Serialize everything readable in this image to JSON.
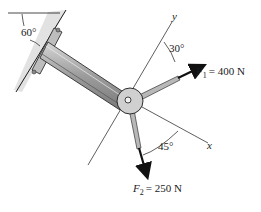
{
  "diagram": {
    "type": "statics-force-diagram",
    "wall_angle_label": "60°",
    "axes": {
      "y_label": "y",
      "x_label": "x"
    },
    "forces": [
      {
        "name": "F1",
        "symbol": "F",
        "subscript": "1",
        "value_text": "= 400 N",
        "angle_label": "30°",
        "angle_reference": "y"
      },
      {
        "name": "F2",
        "symbol": "F",
        "subscript": "2",
        "value_text": "= 250 N",
        "angle_label": "45°",
        "angle_reference": "x"
      }
    ],
    "colors": {
      "line": "#1a1a1a",
      "member_fill": "#a8a8a8",
      "member_dark": "#6e6e6e",
      "wall_fill": "#d9d9d9",
      "hub_fill": "#cfcfcf"
    }
  }
}
